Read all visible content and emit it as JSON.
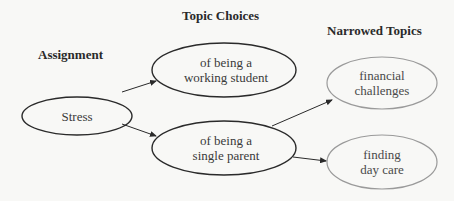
{
  "headings": {
    "assignment": "Assignment",
    "topic_choices": "Topic Choices",
    "narrowed_topics": "Narrowed Topics"
  },
  "nodes": {
    "stress": {
      "line1": "Stress",
      "line2": ""
    },
    "working_student": {
      "line1": "of being a",
      "line2": "working student"
    },
    "single_parent": {
      "line1": "of being a",
      "line2": "single parent"
    },
    "financial_challenges": {
      "line1": "financial",
      "line2": "challenges"
    },
    "finding_day_care": {
      "line1": "finding",
      "line2": "day care"
    }
  },
  "edges": [
    {
      "from": "Stress",
      "to": "of being a working student"
    },
    {
      "from": "Stress",
      "to": "of being a single parent"
    },
    {
      "from": "of being a single parent",
      "to": "financial challenges"
    },
    {
      "from": "of being a single parent",
      "to": "finding day care"
    }
  ],
  "colors": {
    "primary_outline": "#2a2a2a",
    "secondary_outline": "#9a9a9a",
    "background": "#f8f8f6"
  }
}
